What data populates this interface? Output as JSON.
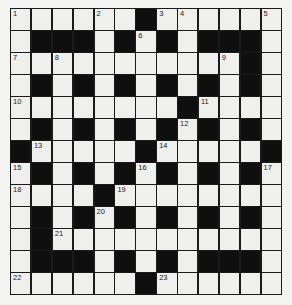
{
  "puzzle": {
    "type": "crossword",
    "rows": 13,
    "cols": 13,
    "grid": [
      "WWWWWWBWWWWWW",
      "WBBBWBWBWBBBW",
      "WWWWWWWWWWWBW",
      "WBWBWBWBWBWBW",
      "WWWWWWWWBWWWW",
      "WBWBWBWBWBWBW",
      "BWWWWWBWWWWWB",
      "WBWBWBWBWBWBW",
      "WWWWBWWWWWWWW",
      "WBWBWBWBWBWBW",
      "WBWWWWWWWWWWW",
      "WBBBWBWBWBBBW",
      "WWWWWWBWWWWWW"
    ],
    "numbers": [
      {
        "r": 0,
        "c": 0,
        "n": "1"
      },
      {
        "r": 0,
        "c": 4,
        "n": "2"
      },
      {
        "r": 0,
        "c": 7,
        "n": "3"
      },
      {
        "r": 0,
        "c": 8,
        "n": "4"
      },
      {
        "r": 0,
        "c": 12,
        "n": "5"
      },
      {
        "r": 1,
        "c": 6,
        "n": "6"
      },
      {
        "r": 2,
        "c": 0,
        "n": "7"
      },
      {
        "r": 2,
        "c": 2,
        "n": "8"
      },
      {
        "r": 2,
        "c": 10,
        "n": "9"
      },
      {
        "r": 4,
        "c": 0,
        "n": "10"
      },
      {
        "r": 4,
        "c": 9,
        "n": "11"
      },
      {
        "r": 5,
        "c": 8,
        "n": "12"
      },
      {
        "r": 6,
        "c": 1,
        "n": "13"
      },
      {
        "r": 6,
        "c": 7,
        "n": "14"
      },
      {
        "r": 7,
        "c": 0,
        "n": "15"
      },
      {
        "r": 7,
        "c": 6,
        "n": "16"
      },
      {
        "r": 7,
        "c": 12,
        "n": "17"
      },
      {
        "r": 8,
        "c": 0,
        "n": "18"
      },
      {
        "r": 8,
        "c": 5,
        "n": "19"
      },
      {
        "r": 9,
        "c": 4,
        "n": "20"
      },
      {
        "r": 10,
        "c": 2,
        "n": "21"
      },
      {
        "r": 12,
        "c": 0,
        "n": "22"
      },
      {
        "r": 12,
        "c": 7,
        "n": "23"
      }
    ]
  },
  "colors": {
    "background": "#f3f3f1",
    "cell_white": "#efefed",
    "cell_black": "#0f0f0f",
    "grid_line": "#1a1a1a"
  }
}
